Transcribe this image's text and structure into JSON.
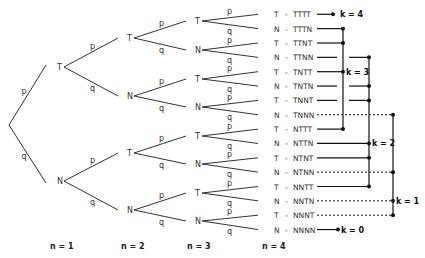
{
  "diagram": {
    "type": "probability-tree",
    "edge_labels": {
      "success": "p",
      "failure": "q"
    },
    "levels": [
      {
        "label": "n = 1",
        "nodes": [
          "T",
          "N"
        ]
      },
      {
        "label": "n = 2",
        "nodes": [
          "T",
          "N",
          "T",
          "N"
        ]
      },
      {
        "label": "n = 3",
        "nodes": [
          "T",
          "N",
          "T",
          "N",
          "T",
          "N",
          "T",
          "N"
        ]
      },
      {
        "label": "n = 4",
        "nodes": [
          "T",
          "N",
          "T",
          "N",
          "T",
          "N",
          "T",
          "N",
          "T",
          "N",
          "T",
          "N",
          "T",
          "N",
          "T",
          "N"
        ]
      }
    ],
    "leaves": [
      {
        "node": "T",
        "sep": "-",
        "seq": "TTTT",
        "k": 4
      },
      {
        "node": "N",
        "sep": "-",
        "seq": "TTTN",
        "k": 3
      },
      {
        "node": "T",
        "sep": "-",
        "seq": "TTNT",
        "k": 3
      },
      {
        "node": "N",
        "sep": "-",
        "seq": "TTNN",
        "k": 2
      },
      {
        "node": "T",
        "sep": "-",
        "seq": "TNTT",
        "k": 3
      },
      {
        "node": "N",
        "sep": "-",
        "seq": "TNTN",
        "k": 2
      },
      {
        "node": "T",
        "sep": "-",
        "seq": "TNNT",
        "k": 2
      },
      {
        "node": "N",
        "sep": "-",
        "seq": "TNNN",
        "k": 1
      },
      {
        "node": "T",
        "sep": "-",
        "seq": "NTTT",
        "k": 3
      },
      {
        "node": "N",
        "sep": "-",
        "seq": "NTTN",
        "k": 2
      },
      {
        "node": "T",
        "sep": "-",
        "seq": "NTNT",
        "k": 2
      },
      {
        "node": "N",
        "sep": "-",
        "seq": "NTNN",
        "k": 1
      },
      {
        "node": "T",
        "sep": "-",
        "seq": "NNTT",
        "k": 2
      },
      {
        "node": "N",
        "sep": "-",
        "seq": "NNTN",
        "k": 1
      },
      {
        "node": "T",
        "sep": "-",
        "seq": "NNNT",
        "k": 1
      },
      {
        "node": "N",
        "sep": "-",
        "seq": "NNNN",
        "k": 0
      }
    ],
    "groups": [
      {
        "label": "k = 4"
      },
      {
        "label": "k = 3"
      },
      {
        "label": "k = 2"
      },
      {
        "label": "k = 1"
      },
      {
        "label": "k = 0"
      }
    ]
  }
}
